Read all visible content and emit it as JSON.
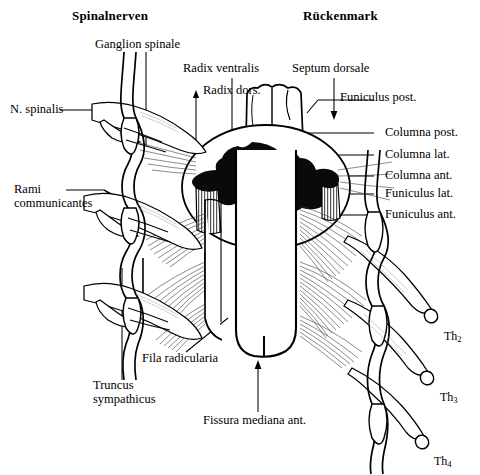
{
  "figure": {
    "title_left": "Spinalnerven",
    "title_right": "Rückenmark",
    "type": "anatomical-diagram",
    "language": "la-de",
    "ink_color": "#000000",
    "background_color": "#ffffff"
  },
  "labels": {
    "ganglion_spinale": "Ganglion spinale",
    "radix_ventralis": "Radix ventralis",
    "radix_dorsalis": "Radix dors.",
    "septum_dorsale": "Septum dorsale",
    "funiculus_post": "Funiculus post.",
    "n_spinalis": "N. spinalis",
    "rami_communicantes_1": "Rami",
    "rami_communicantes_2": "communicantes",
    "columna_post": "Columna post.",
    "columna_lat": "Columna lat.",
    "columna_ant": "Columna ant.",
    "funiculus_lat": "Funiculus lat.",
    "funiculus_ant": "Funiculus ant.",
    "fila_radicularia": "Fila radicularia",
    "truncus_1": "Truncus",
    "truncus_2": "sympathicus",
    "fissura_mediana_ant": "Fissura mediana ant.",
    "th2_base": "Th",
    "th2_sub": "2",
    "th3_base": "Th",
    "th3_sub": "3",
    "th4_base": "Th",
    "th4_sub": "4"
  }
}
